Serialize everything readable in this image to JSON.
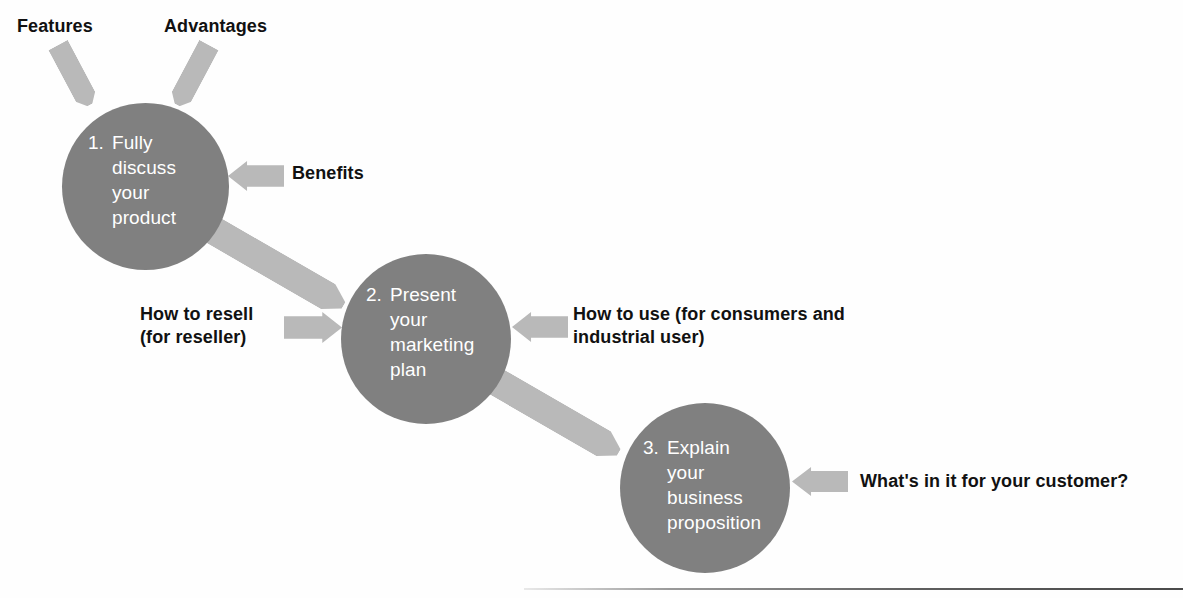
{
  "diagram": {
    "colors": {
      "circle_fill": "#808080",
      "arrow_fill": "#b9b9b9",
      "circle_text": "#ffffff",
      "label_text": "#111111",
      "background": "#ffffff"
    },
    "nodes": [
      {
        "number": "1.",
        "text": "Fully\ndiscuss\nyour\nproduct"
      },
      {
        "number": "2.",
        "text": "Present\nyour\nmarketing\nplan"
      },
      {
        "number": "3.",
        "text": "Explain\nyour\nbusiness\nproposition"
      }
    ],
    "labels": {
      "features": "Features",
      "advantages": "Advantages",
      "benefits": "Benefits",
      "how_to_resell": "How to resell\n(for reseller)",
      "how_to_use": "How to use (for consumers and\nindustrial user)",
      "whats_in_it": "What's in it for your customer?"
    }
  }
}
